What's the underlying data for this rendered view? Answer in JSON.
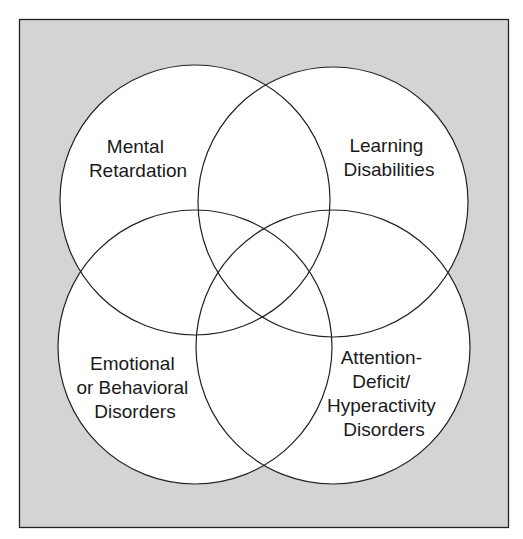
{
  "diagram": {
    "type": "venn",
    "background_color": "#d4d4d4",
    "circle_fill": "#ffffff",
    "stroke_color": "#222222",
    "circles": [
      {
        "id": "mental-retardation",
        "lines": [
          "Mental",
          "Retardation"
        ]
      },
      {
        "id": "learning-disabilities",
        "lines": [
          "Learning",
          "Disabilities"
        ]
      },
      {
        "id": "emotional-behavioral",
        "lines": [
          "Emotional",
          "or Behavioral",
          "Disorders"
        ]
      },
      {
        "id": "adhd",
        "lines": [
          "Attention-",
          "Deficit/",
          "Hyperactivity",
          "Disorders"
        ]
      }
    ]
  }
}
